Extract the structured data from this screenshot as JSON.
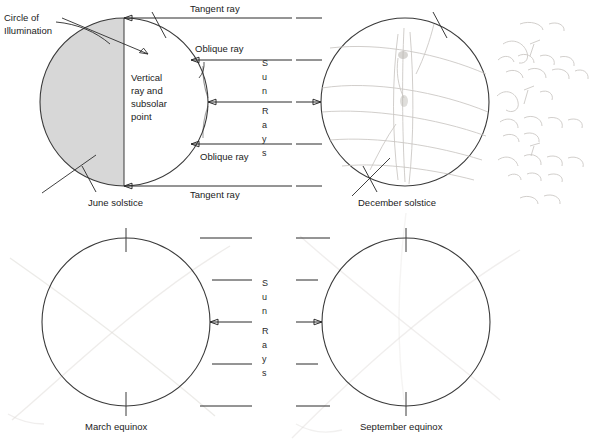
{
  "figure": {
    "background_color": "#ffffff",
    "line_color": "#2b2b2b",
    "shade_color": "#d7d7d7",
    "pencil_color": "#c9c6c2"
  },
  "sun_rays_label": {
    "letters": [
      "S",
      "u",
      "n",
      "R",
      "a",
      "y",
      "s"
    ],
    "text": "Sun Rays"
  },
  "panels": [
    {
      "id": "june-solstice",
      "caption": "June solstice",
      "shaded": true,
      "labels": {
        "circle_of_illumination": "Circle of\nIllumination",
        "circle_of_illumination_line1": "Circle of",
        "circle_of_illumination_line2": "Illumination",
        "tangent_ray_top": "Tangent ray",
        "tangent_ray_bottom": "Tangent ray",
        "oblique_ray_top": "Oblique ray",
        "oblique_ray_bottom": "Oblique ray",
        "vertical_ray_line1": "Vertical",
        "vertical_ray_line2": "ray and",
        "vertical_ray_line3": "subsolar",
        "vertical_ray_line4": "point"
      }
    },
    {
      "id": "december-solstice",
      "caption": "December solstice",
      "shaded": false,
      "labels": {}
    },
    {
      "id": "march-equinox",
      "caption": "March equinox",
      "shaded": false,
      "labels": {}
    },
    {
      "id": "september-equinox",
      "caption": "September equinox",
      "shaded": false,
      "labels": {}
    }
  ]
}
